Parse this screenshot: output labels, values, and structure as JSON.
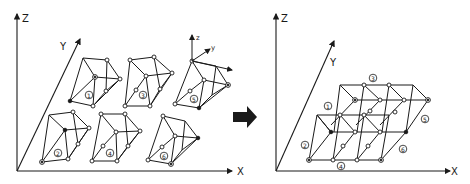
{
  "figure": {
    "left_panel": {
      "axes": {
        "z_label": "Z",
        "y_label": "Y",
        "x_label": "X"
      },
      "local_axes": {
        "z_label": "z",
        "y_label": "y",
        "x_label": "x"
      },
      "modules": [
        {
          "id": "1",
          "label": "①"
        },
        {
          "id": "3",
          "label": "③"
        },
        {
          "id": "5",
          "label": "⑤"
        },
        {
          "id": "2",
          "label": "②"
        },
        {
          "id": "4",
          "label": "④"
        },
        {
          "id": "6",
          "label": "⑥"
        }
      ]
    },
    "transition_arrow": "right-arrow",
    "right_panel": {
      "axes": {
        "z_label": "Z",
        "y_label": "Y",
        "x_label": "X"
      },
      "labels": [
        {
          "id": "1",
          "label": "①"
        },
        {
          "id": "2",
          "label": "②"
        },
        {
          "id": "3",
          "label": "③"
        },
        {
          "id": "4",
          "label": "④"
        },
        {
          "id": "5",
          "label": "⑤"
        },
        {
          "id": "6",
          "label": "⑥"
        }
      ]
    }
  }
}
